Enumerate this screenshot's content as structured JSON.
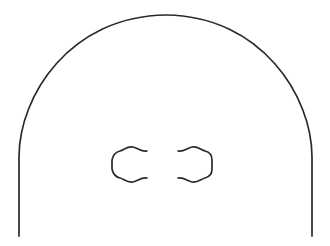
{
  "canvas": {
    "width": 330,
    "height": 246,
    "background_color": "#ffffff",
    "title": "Line drawing of an arch with two bracket shapes"
  },
  "style": {
    "stroke_color": "#2a2a2a",
    "stroke_width": 1.7,
    "inner_stroke_width": 1.7,
    "fill": "none"
  },
  "shapes": {
    "outer_arch": {
      "name": "arch-outline",
      "description": "Large rounded dome / arch open at the bottom with straight vertical legs",
      "apex_y": 15,
      "apex_x": 165,
      "left_leg_x": 19,
      "right_leg_x": 312,
      "leg_bottom_y": 236,
      "leg_top_y": 155,
      "path": "M 19 236 L 19 157 C 19 96 70 16 166 15 C 261 16 312 96 312 157 L 312 236"
    },
    "left_bracket": {
      "name": "left-bracket-shape",
      "description": "C-shaped bracket opening to the right with wavy top and bottom edges",
      "left_x": 112,
      "right_x": 148,
      "top_y": 148,
      "bottom_y": 181,
      "path": "M 147 151 C 141 152 138 148 133 147 C 127 146 124 150 120 151 C 116 152 113 155 112 160 L 112 169 C 113 174 116 177 120 178 C 124 179 127 183 133 182 C 138 181 141 177 147 178"
    },
    "right_bracket": {
      "name": "right-bracket-shape",
      "description": "Reversed C-shaped bracket opening to the left with wavy top and bottom edges, mirror of left bracket",
      "left_x": 177,
      "right_x": 212,
      "top_y": 148,
      "bottom_y": 181,
      "path": "M 178 151 C 184 152 187 148 192 147 C 198 146 201 150 205 151 C 209 152 212 155 212 160 L 212 169 C 212 174 209 177 205 178 C 201 179 198 183 192 182 C 187 181 184 177 178 178"
    }
  }
}
